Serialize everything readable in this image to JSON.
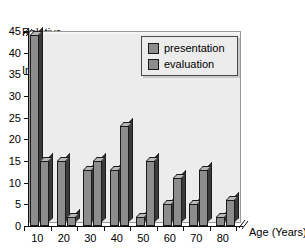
{
  "chart_data": {
    "type": "bar",
    "title": "Relative Incidence",
    "title_line1": "Relative",
    "title_line2": "Incidence",
    "xlabel": "Age (Years)",
    "ylabel": "Relative Incidence",
    "categories": [
      "10",
      "20",
      "30",
      "40",
      "50",
      "60",
      "70",
      "80"
    ],
    "series": [
      {
        "name": "presentation",
        "values": [
          44,
          15,
          13,
          13,
          2,
          5,
          5,
          2
        ],
        "color": "#8d8d8d"
      },
      {
        "name": "evaluation",
        "values": [
          15,
          2,
          15,
          23,
          15,
          11,
          13,
          6
        ],
        "color": "#8d8d8d"
      }
    ],
    "ylim": [
      0,
      45
    ],
    "yticks": [
      "0",
      "5",
      "10",
      "15",
      "20",
      "25",
      "30",
      "35",
      "40",
      "45"
    ],
    "xticks": [
      "10",
      "20",
      "30",
      "40",
      "50",
      "60",
      "70",
      "80"
    ],
    "grid": false,
    "legend_position": "top-right",
    "axis_break_y_top": true,
    "axis_break_x_right": true
  },
  "legend": {
    "items": [
      {
        "label": "presentation"
      },
      {
        "label": "evaluation"
      }
    ]
  },
  "colors": {
    "bar_face": "#8d8d8d",
    "bar_side": "#3a3a3a",
    "bar_top": "#b8b8b8",
    "plot_background": "#ececec",
    "axis": "#111111",
    "page_background": "#ffffff"
  }
}
